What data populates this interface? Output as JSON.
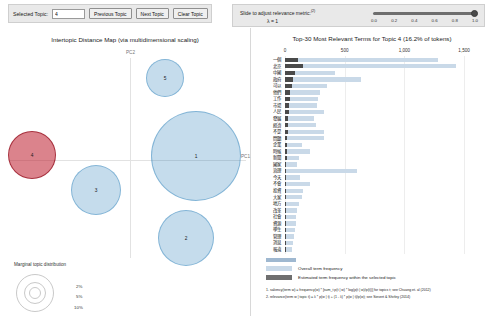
{
  "controls": {
    "selected_topic_label": "Selected Topic:",
    "selected_topic_value": "4",
    "previous_topic": "Previous Topic",
    "next_topic": "Next Topic",
    "clear_topic": "Clear Topic"
  },
  "slider": {
    "title": "Slide to adjust relevance metric:",
    "superscript": "(2)",
    "lambda_label": "λ = 1",
    "value": "1.0",
    "ticks": [
      "0.0",
      "0.2",
      "0.4",
      "0.6",
      "0.8",
      "1.0"
    ]
  },
  "left_panel": {
    "title": "Intertopic Distance Map (via multidimensional scaling)",
    "axis_x": "PC1",
    "axis_y": "PC2",
    "topics": [
      {
        "id": "1",
        "x": 188,
        "y": 106,
        "r": 45
      },
      {
        "id": "2",
        "x": 178,
        "y": 188,
        "r": 28
      },
      {
        "id": "3",
        "x": 88,
        "y": 140,
        "r": 25
      },
      {
        "id": "4",
        "x": 24,
        "y": 105,
        "r": 24,
        "selected": true
      },
      {
        "id": "5",
        "x": 157,
        "y": 28,
        "r": 19
      }
    ],
    "legend": {
      "caption": "Marginal topic distribution",
      "values": [
        "2%",
        "5%",
        "10%"
      ]
    }
  },
  "right_panel": {
    "title": "Top-30 Most Relevant Terms for Topic 4 (16.2% of tokens)",
    "axis_ticks": [
      "0",
      "500",
      "1,000",
      "1,500"
    ],
    "axis_max": 1700,
    "legend": {
      "overall": "Overall term frequency",
      "topic": "Estimated term frequency within the selected topic"
    },
    "footnotes": [
      "1. saliency(term w) = frequency(w) * [sum_t p(t | w) * log(p(t | w)/p(t))] for topics t; see Chuang et. al (2012)",
      "2. relevance(term w | topic t) = λ * p(w | t) + (1 - λ) * p(w | t)/p(w); see Sievert & Shirley (2014)"
    ],
    "terms": [
      {
        "term": "一個",
        "overall": 1280,
        "topic": 105
      },
      {
        "term": "北京",
        "overall": 1430,
        "topic": 150
      },
      {
        "term": "中國",
        "overall": 420,
        "topic": 82
      },
      {
        "term": "政府",
        "overall": 640,
        "topic": 70
      },
      {
        "term": "可以",
        "overall": 350,
        "topic": 58
      },
      {
        "term": "他們",
        "overall": 290,
        "topic": 46
      },
      {
        "term": "工作",
        "overall": 275,
        "topic": 40
      },
      {
        "term": "市場",
        "overall": 265,
        "topic": 34
      },
      {
        "term": "人民",
        "overall": 330,
        "topic": 30
      },
      {
        "term": "發展",
        "overall": 240,
        "topic": 26
      },
      {
        "term": "經濟",
        "overall": 260,
        "topic": 24
      },
      {
        "term": "不是",
        "overall": 330,
        "topic": 22
      },
      {
        "term": "問題",
        "overall": 330,
        "topic": 20
      },
      {
        "term": "企業",
        "overall": 140,
        "topic": 18
      },
      {
        "term": "時候",
        "overall": 210,
        "topic": 16
      },
      {
        "term": "新聞",
        "overall": 115,
        "topic": 14
      },
      {
        "term": "國家",
        "overall": 100,
        "topic": 12
      },
      {
        "term": "治理",
        "overall": 600,
        "topic": 11
      },
      {
        "term": "今天",
        "overall": 125,
        "topic": 10
      },
      {
        "term": "不會",
        "overall": 210,
        "topic": 9
      },
      {
        "term": "投資",
        "overall": 150,
        "topic": 9
      },
      {
        "term": "大家",
        "overall": 140,
        "topic": 8
      },
      {
        "term": "地方",
        "overall": 120,
        "topic": 8
      },
      {
        "term": "改革",
        "overall": 100,
        "topic": 7
      },
      {
        "term": "社會",
        "overall": 95,
        "topic": 7
      },
      {
        "term": "資源",
        "overall": 88,
        "topic": 6
      },
      {
        "term": "學生",
        "overall": 80,
        "topic": 6
      },
      {
        "term": "管理",
        "overall": 72,
        "topic": 5
      },
      {
        "term": "消息",
        "overall": 66,
        "topic": 5
      },
      {
        "term": "報道",
        "overall": 60,
        "topic": 4
      }
    ]
  },
  "chart_data": {
    "type": "bar",
    "title": "Top-30 Most Relevant Terms for Topic 4 (16.2% of tokens)",
    "xlabel": "",
    "ylabel": "",
    "xlim": [
      0,
      1700
    ],
    "orientation": "horizontal",
    "grid": true,
    "legend_position": "bottom",
    "categories": [
      "一個",
      "北京",
      "中國",
      "政府",
      "可以",
      "他們",
      "工作",
      "市場",
      "人民",
      "發展",
      "經濟",
      "不是",
      "問題",
      "企業",
      "時候",
      "新聞",
      "國家",
      "治理",
      "今天",
      "不會",
      "投資",
      "大家",
      "地方",
      "改革",
      "社會",
      "資源",
      "學生",
      "管理",
      "消息",
      "報道"
    ],
    "series": [
      {
        "name": "Overall term frequency",
        "values": [
          1280,
          1430,
          420,
          640,
          350,
          290,
          275,
          265,
          330,
          240,
          260,
          330,
          330,
          140,
          210,
          115,
          100,
          600,
          125,
          210,
          150,
          140,
          120,
          100,
          95,
          88,
          80,
          72,
          66,
          60
        ]
      },
      {
        "name": "Estimated term frequency within the selected topic",
        "values": [
          105,
          150,
          82,
          70,
          58,
          46,
          40,
          34,
          30,
          26,
          24,
          22,
          20,
          18,
          16,
          14,
          12,
          11,
          10,
          9,
          9,
          8,
          8,
          7,
          7,
          6,
          6,
          5,
          5,
          4
        ]
      }
    ]
  }
}
